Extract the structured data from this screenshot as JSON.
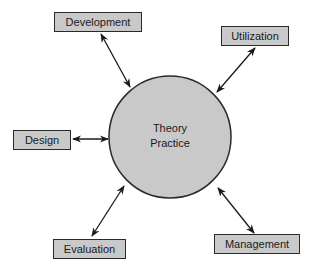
{
  "diagram": {
    "center": {
      "lines": [
        "Theory",
        "Practice"
      ],
      "fill": "#c9c9c9",
      "stroke": "#2a2a2a"
    },
    "nodes": [
      {
        "id": "development",
        "label": "Development"
      },
      {
        "id": "utilization",
        "label": "Utilization"
      },
      {
        "id": "design",
        "label": "Design"
      },
      {
        "id": "evaluation",
        "label": "Evaluation"
      },
      {
        "id": "management",
        "label": "Management"
      }
    ],
    "edges": [
      {
        "from": "development",
        "to": "center",
        "type": "bidirectional"
      },
      {
        "from": "utilization",
        "to": "center",
        "type": "bidirectional"
      },
      {
        "from": "design",
        "to": "center",
        "type": "bidirectional"
      },
      {
        "from": "evaluation",
        "to": "center",
        "type": "bidirectional"
      },
      {
        "from": "management",
        "to": "center",
        "type": "bidirectional"
      }
    ]
  }
}
